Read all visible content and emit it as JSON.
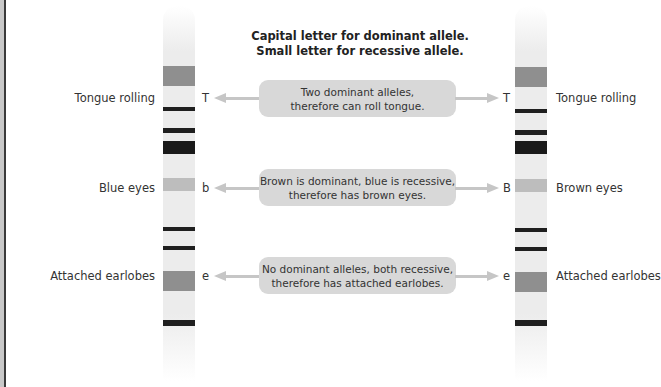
{
  "heading": {
    "line1": "Capital letter for dominant allele.",
    "line2": "Small letter for recessive allele."
  },
  "colors": {
    "chromosome": "#ececec",
    "band_dark": "#1f1f1f",
    "band_gray": "#8f8f8f",
    "band_light": "#bdbdbd",
    "box": "#d8d8d8",
    "arrow": "#c6c6c6"
  },
  "rows": [
    {
      "left_trait": "Tongue rolling",
      "left_allele": "T",
      "explanation_line1": "Two dominant alleles,",
      "explanation_line2": "therefore can roll tongue.",
      "right_allele": "T",
      "right_trait": "Tongue rolling"
    },
    {
      "left_trait": "Blue eyes",
      "left_allele": "b",
      "explanation_line1": "Brown is dominant, blue is recessive,",
      "explanation_line2": "therefore has brown eyes.",
      "right_allele": "B",
      "right_trait": "Brown eyes"
    },
    {
      "left_trait": "Attached earlobes",
      "left_allele": "e",
      "explanation_line1": "No dominant alleles, both recessive,",
      "explanation_line2": "therefore has attached earlobes.",
      "right_allele": "e",
      "right_trait": "Attached earlobes"
    }
  ],
  "chromosomes": {
    "left": {
      "label": "maternal chromosome"
    },
    "right": {
      "label": "paternal chromosome"
    }
  }
}
